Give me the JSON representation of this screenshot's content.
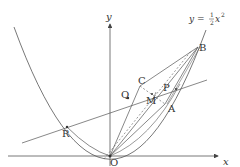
{
  "diagram": {
    "type": "coordinate-geometry",
    "curve_equation": {
      "prefix": "y = ",
      "fraction_num": "1",
      "fraction_den": "2",
      "var": "x",
      "exponent": "2"
    },
    "axes": {
      "x_label": "x",
      "y_label": "y",
      "origin_label": "O"
    },
    "points": [
      {
        "name": "O",
        "label": "O"
      },
      {
        "name": "A",
        "label": "A"
      },
      {
        "name": "B",
        "label": "B"
      },
      {
        "name": "C",
        "label": "C"
      },
      {
        "name": "P",
        "label": "P"
      },
      {
        "name": "Q",
        "label": "Q"
      },
      {
        "name": "M",
        "label": "M"
      },
      {
        "name": "R",
        "label": "R"
      }
    ],
    "segments": [
      {
        "from": "O",
        "to": "B",
        "style": "solid"
      },
      {
        "from": "O",
        "to": "A",
        "style": "solid"
      },
      {
        "from": "A",
        "to": "B",
        "style": "solid"
      },
      {
        "from": "O",
        "to": "C",
        "style": "solid"
      },
      {
        "from": "C",
        "to": "B",
        "style": "solid"
      },
      {
        "from": "C",
        "to": "A",
        "style": "dashed"
      },
      {
        "from": "O",
        "to": "M",
        "style": "dashed"
      },
      {
        "from": "M",
        "to": "B",
        "style": "dashed"
      },
      {
        "from": "R",
        "to": "P",
        "style": "solid",
        "extended": true
      }
    ],
    "colors": {
      "stroke": "#444444",
      "background": "#ffffff"
    }
  }
}
